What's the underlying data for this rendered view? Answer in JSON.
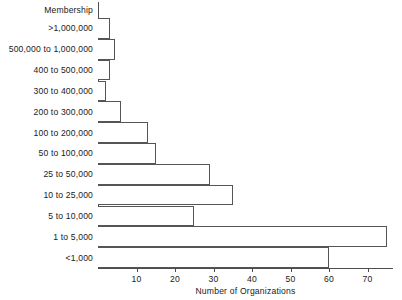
{
  "chart_data": {
    "type": "bar",
    "orientation": "horizontal",
    "title": "",
    "xlabel": "Number of Organizations",
    "ylabel": "Membership",
    "categories": [
      ">1,000,000",
      "500,000 to 1,000,000",
      "400 to 500,000",
      "300 to 400,000",
      "200 to 300,000",
      "100 to 200,000",
      "50 to 100,000",
      "25 to 50,000",
      "10 to 25,000",
      "5 to 10,000",
      "1 to 5,000",
      "<1,000"
    ],
    "values": [
      3,
      4.5,
      3,
      2,
      6,
      13,
      15,
      29,
      35,
      25,
      75,
      60
    ],
    "xlim": [
      0,
      76
    ],
    "xticks": [
      10,
      20,
      30,
      40,
      50,
      60,
      70
    ],
    "xtick_labels": [
      "10",
      "20",
      "30",
      "40",
      "50",
      "60",
      "70"
    ],
    "grid": false,
    "legend": false,
    "bar_fill": "#ffffff",
    "bar_stroke": "#555555",
    "axis_color": "#4d4d4d"
  }
}
